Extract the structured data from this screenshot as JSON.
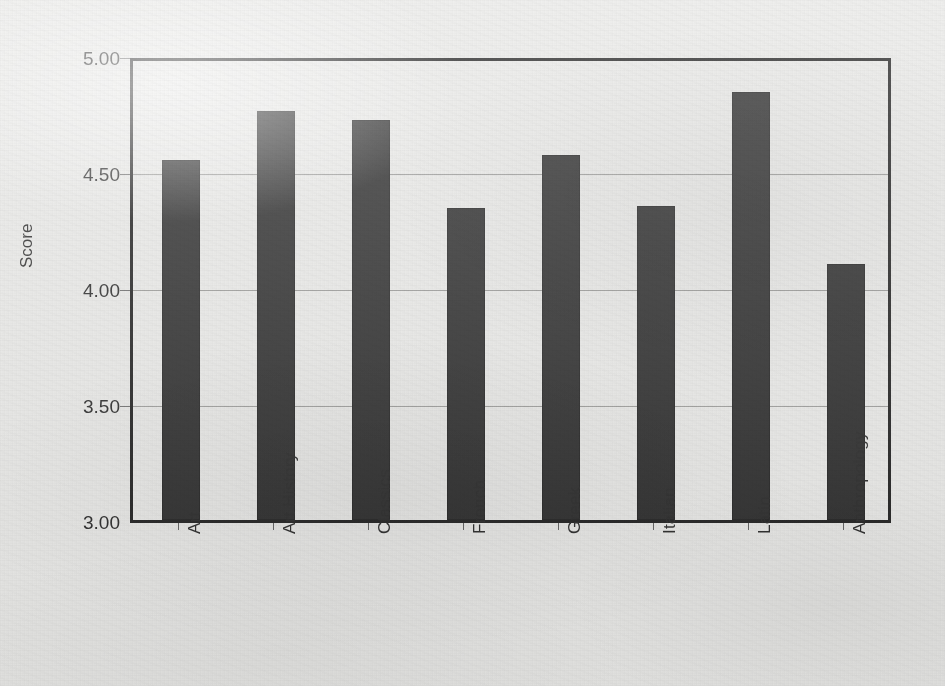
{
  "chart_data": {
    "type": "bar",
    "title": "",
    "xlabel": "",
    "ylabel": "Score",
    "ylim": [
      3.0,
      5.0
    ],
    "ytick_labels": [
      "5.00",
      "4.50",
      "4.00",
      "3.50",
      "3.00"
    ],
    "ytick_values": [
      5.0,
      4.5,
      4.0,
      3.5,
      3.0
    ],
    "grid": "horizontal",
    "legend": "none",
    "bar_color": "#272727",
    "axis_color": "#1b1b1b",
    "gridline_color": "#9a9a98",
    "background_color": "#e9e9e7",
    "categories": [
      "Art",
      "Art History",
      "Classics",
      "French",
      "Greek",
      "Italian",
      "Latin",
      "Anthropology"
    ],
    "values": [
      4.55,
      4.76,
      4.72,
      4.34,
      4.57,
      4.35,
      4.84,
      4.1
    ]
  }
}
